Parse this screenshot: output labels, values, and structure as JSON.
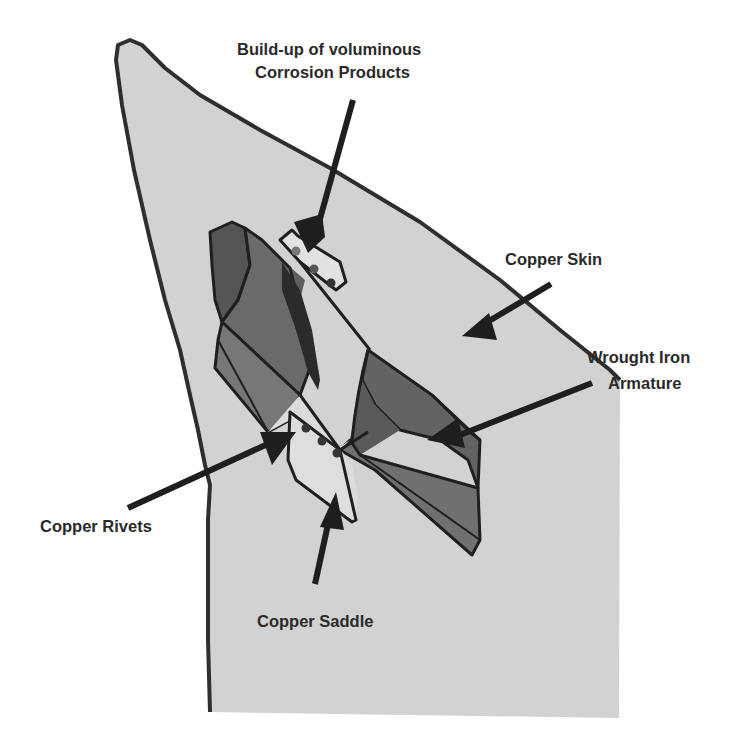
{
  "diagram": {
    "labels": {
      "corrosion_line1": "Build-up of voluminous",
      "corrosion_line2": "Corrosion Products",
      "copper_skin": "Copper Skin",
      "armature_line1": "Wrought Iron",
      "armature_line2": "Armature",
      "copper_rivets": "Copper Rivets",
      "copper_saddle": "Copper Saddle"
    },
    "colors": {
      "background": "#ffffff",
      "skin_fill": "#d2d2d2",
      "outline": "#2e2e2e",
      "armature_dark": "#4a4a4a",
      "armature_mid": "#6a6a6a",
      "armature_light": "#7a7a7a",
      "saddle_fill": "#dcdcdc",
      "arrow": "#1e1e1e",
      "text": "#2a2a2a"
    }
  }
}
